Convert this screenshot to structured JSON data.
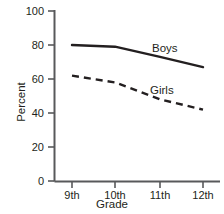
{
  "chart_data": {
    "type": "line",
    "title": "",
    "xlabel": "Grade",
    "ylabel": "Percent",
    "categories": [
      "9th",
      "10th",
      "11th",
      "12th"
    ],
    "ylim": [
      0,
      100
    ],
    "yticks": [
      "0",
      "20",
      "40",
      "60",
      "80",
      "100"
    ],
    "grid": false,
    "legend_position": "inline-right",
    "series": [
      {
        "name": "Boys",
        "values": [
          80,
          79,
          73,
          67
        ],
        "style": "solid",
        "color": "#231f20"
      },
      {
        "name": "Girls",
        "values": [
          62,
          58,
          48,
          42
        ],
        "style": "dashed",
        "color": "#231f20"
      }
    ]
  },
  "axis": {
    "y_title": "Percent",
    "x_title": "Grade",
    "y_tick_0": "0",
    "y_tick_1": "20",
    "y_tick_2": "40",
    "y_tick_3": "60",
    "y_tick_4": "80",
    "y_tick_5": "100",
    "x_tick_0": "9th",
    "x_tick_1": "10th",
    "x_tick_2": "11th",
    "x_tick_3": "12th"
  },
  "labels": {
    "boys": "Boys",
    "girls": "Girls"
  },
  "colors": {
    "axis": "#58595b",
    "line": "#231f20",
    "text": "#231f20",
    "background": "#ffffff"
  }
}
